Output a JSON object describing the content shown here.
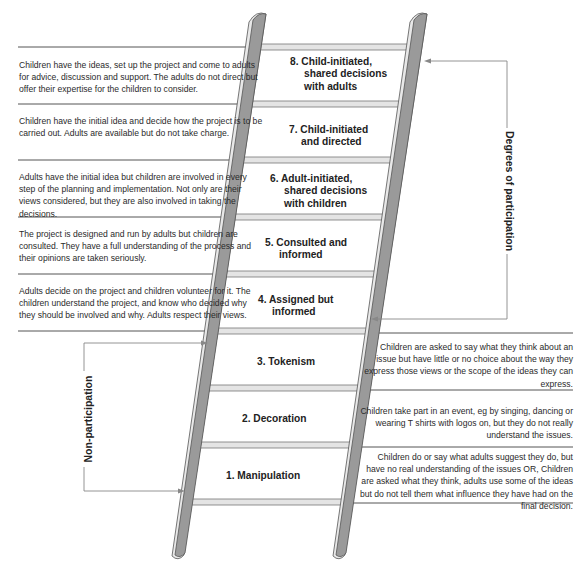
{
  "diagram": {
    "colors": {
      "rail_fill": "#9a9a9a",
      "rail_edge": "#555555",
      "rung_fill": "#e4e4e4",
      "divider": "#555555",
      "bracket": "#888888"
    },
    "brackets": {
      "participation_label": "Degrees of participation",
      "non_participation_label": "Non-participation"
    },
    "rungs": [
      {
        "level": 8,
        "label_line1": "8. Child-initiated,",
        "label_line2": "shared decisions",
        "label_line3": "with adults",
        "description": "Children have the ideas, set up the project and come to adults for advice, discussion and support. The adults do not direct but offer their expertise for the children to consider."
      },
      {
        "level": 7,
        "label_line1": "7. Child-initiated",
        "label_line2": "and directed",
        "label_line3": "",
        "description": "Children have the initial idea and decide how the project is to be carried out. Adults are available but do not take charge."
      },
      {
        "level": 6,
        "label_line1": "6. Adult-initiated,",
        "label_line2": "shared decisions",
        "label_line3": "with children",
        "description": "Adults have the initial idea but children are involved in every step of the planning and implementation. Not only are their views considered, but they are also involved in taking the decisions."
      },
      {
        "level": 5,
        "label_line1": "5. Consulted and",
        "label_line2": "informed",
        "label_line3": "",
        "description": "The project is designed and run by adults but children are consulted. They have a full understanding of the process and their opinions are taken seriously."
      },
      {
        "level": 4,
        "label_line1": "4. Assigned but",
        "label_line2": "informed",
        "label_line3": "",
        "description": "Adults decide on the project and children volunteer for it. The children understand the project, and know who decided why they should be involved and why. Adults respect their views."
      },
      {
        "level": 3,
        "label_line1": "3. Tokenism",
        "label_line2": "",
        "label_line3": "",
        "description": "Children are asked to say what they think about an issue but have little or no choice about the way they express those views or the scope of the ideas they can express."
      },
      {
        "level": 2,
        "label_line1": "2. Decoration",
        "label_line2": "",
        "label_line3": "",
        "description": "Children take part in an event, eg by singing, dancing or wearing T shirts with logos on, but they do not really understand the issues."
      },
      {
        "level": 1,
        "label_line1": "1. Manipulation",
        "label_line2": "",
        "label_line3": "",
        "description": "Children do or say what adults suggest they do, but have no real understanding of the issues OR, Children are asked what they think, adults use some of the ideas but do not tell them what influence they have had on the final decision."
      }
    ]
  }
}
